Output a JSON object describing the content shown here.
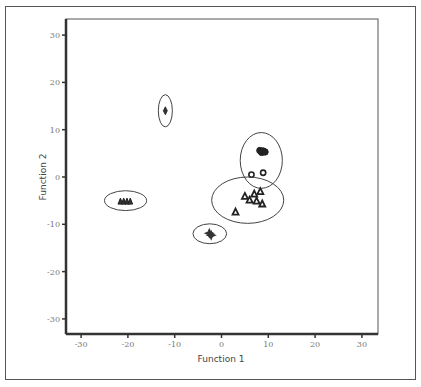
{
  "chart_data": {
    "type": "scatter",
    "title": "",
    "xlabel": "Function 1",
    "ylabel": "Function 2",
    "xlim": [
      -33,
      33
    ],
    "ylim": [
      -33,
      33
    ],
    "x_ticks": [
      "-30",
      "-20",
      "-10",
      "0",
      "10",
      "20",
      "30"
    ],
    "y_ticks": [
      "30",
      "20",
      "10",
      "0",
      "-10",
      "-20",
      "-30"
    ],
    "grid": false,
    "legend": "none",
    "groups": [
      {
        "name": "diamond-group",
        "marker": "diamond",
        "center": [
          -12,
          14
        ],
        "points": [
          [
            -12,
            14
          ]
        ],
        "ellipse_radius": [
          1.5,
          3.4
        ]
      },
      {
        "name": "filled-circle-group",
        "marker": "circle",
        "center": [
          8.5,
          3.5
        ],
        "points": [
          [
            8.2,
            5.6
          ],
          [
            8.6,
            5.2
          ],
          [
            8.9,
            5.5
          ],
          [
            9.3,
            5.3
          ],
          [
            6.4,
            0.5
          ],
          [
            8.9,
            0.9
          ]
        ],
        "ellipse_radius": [
          4.5,
          5.9
        ]
      },
      {
        "name": "triangle-group",
        "marker": "triangle",
        "center": [
          5.6,
          -4.9
        ],
        "points": [
          [
            5,
            -4
          ],
          [
            6,
            -4.8
          ],
          [
            7,
            -3.5
          ],
          [
            7.5,
            -5
          ],
          [
            8.3,
            -3
          ],
          [
            8.7,
            -5.6
          ],
          [
            3,
            -7.3
          ]
        ],
        "ellipse_radius": [
          7.7,
          4.9
        ]
      },
      {
        "name": "star-group",
        "marker": "star",
        "center": [
          -2.5,
          -12
        ],
        "points": [
          [
            -2.6,
            -11.9
          ],
          [
            -2.2,
            -12.3
          ]
        ],
        "ellipse_radius": [
          3.6,
          2.1
        ]
      },
      {
        "name": "inverted-triangle-group",
        "marker": "inverted-triangle",
        "center": [
          -20.5,
          -5
        ],
        "points": [
          [
            -21.6,
            -5.1
          ],
          [
            -20.9,
            -5.1
          ],
          [
            -20.2,
            -5.1
          ],
          [
            -19.5,
            -5.1
          ]
        ],
        "ellipse_radius": [
          4.5,
          2.1
        ]
      }
    ]
  }
}
